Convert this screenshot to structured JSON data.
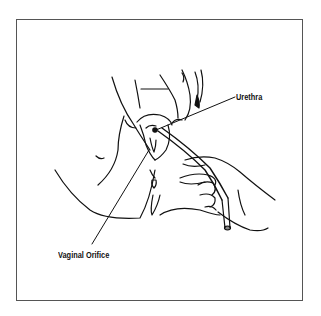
{
  "diagram": {
    "type": "medical-line-illustration",
    "labels": [
      {
        "id": "urethra",
        "text": "Urethra"
      },
      {
        "id": "vaginal_orifice",
        "text": "Vaginal Orifice"
      }
    ],
    "colors": {
      "line": "#111111",
      "background": "#ffffff",
      "frame": "#555555"
    }
  }
}
